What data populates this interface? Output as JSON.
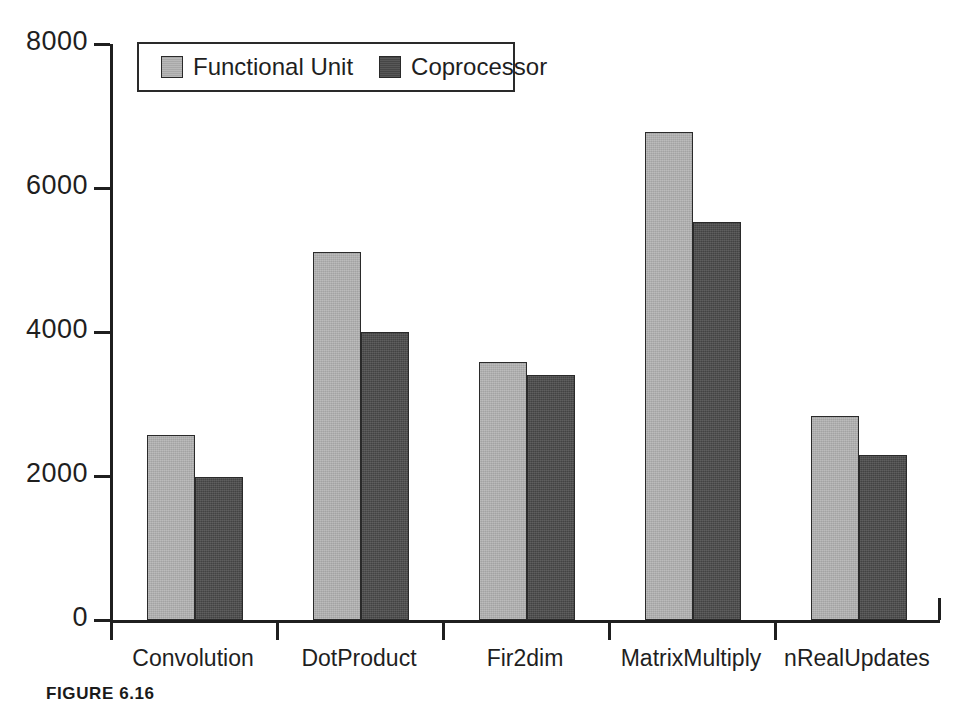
{
  "chart_data": {
    "type": "bar",
    "title": "",
    "subtitle": "",
    "xlabel": "",
    "ylabel": "",
    "categories": [
      "Convolution",
      "DotProduct",
      "Fir2dim",
      "MatrixMultiply",
      "nRealUpdates"
    ],
    "series": [
      {
        "name": "Functional Unit",
        "color": "#b3b3b3",
        "values": [
          2570,
          5110,
          3580,
          6780,
          2830
        ]
      },
      {
        "name": "Coprocessor",
        "color": "#4a4a4a",
        "values": [
          1990,
          4000,
          3400,
          5530,
          2290
        ]
      }
    ],
    "ylim": [
      0,
      8000
    ],
    "yticks": [
      0,
      2000,
      4000,
      6000,
      8000
    ],
    "ytick_labels": [
      "0",
      "2000",
      "4000",
      "6000",
      "8000"
    ],
    "grid": false,
    "legend_position": "top-left",
    "legend_entries": [
      "Functional Unit",
      "Coprocessor"
    ]
  },
  "legend": {
    "entries": [
      {
        "label": "Functional Unit",
        "swatch": "legend-swatch-functional-unit"
      },
      {
        "label": "Coprocessor",
        "swatch": "legend-swatch-coprocessor"
      }
    ]
  },
  "caption": {
    "text": "FIGURE 6.16"
  },
  "colors": {
    "series_functional_unit": "#b3b3b3",
    "series_coprocessor": "#4a4a4a",
    "axis": "#1f1f1f",
    "background": "#ffffff"
  }
}
